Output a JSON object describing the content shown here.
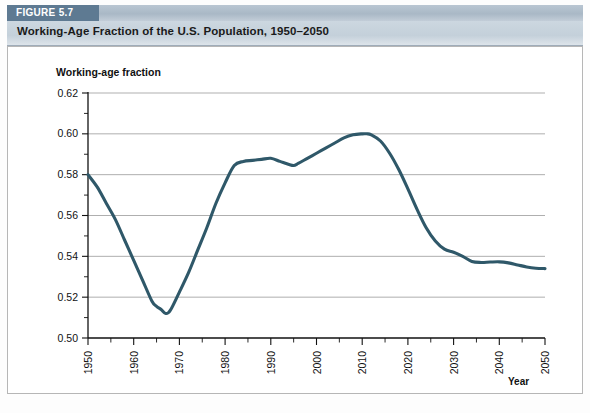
{
  "figure": {
    "tag": "FIGURE 5.7",
    "title": "Working-Age Fraction of the U.S. Population, 1950–2050"
  },
  "colors": {
    "line": "#2f5869",
    "tag_bg": "#5e7a92",
    "title_bg": "#c7d2dc",
    "grid": "#8d8d8d",
    "axis": "#111111"
  },
  "chart_data": {
    "type": "line",
    "title": "Working-Age Fraction of the U.S. Population, 1950–2050",
    "xlabel": "Year",
    "ylabel": "Working-age fraction",
    "xlim": [
      1950,
      2050
    ],
    "ylim": [
      0.5,
      0.62
    ],
    "grid": true,
    "legend": "none",
    "x_ticks": [
      1950,
      1960,
      1970,
      1980,
      1990,
      2000,
      2010,
      2020,
      2030,
      2040,
      2050
    ],
    "x_tick_labels": [
      "1950",
      "1960",
      "1970",
      "1980",
      "1990",
      "2000",
      "2010",
      "2020",
      "2030",
      "2040",
      "2050"
    ],
    "x_minor_step": 5,
    "y_ticks": [
      0.5,
      0.52,
      0.54,
      0.56,
      0.58,
      0.6,
      0.62
    ],
    "y_tick_labels": [
      "0.50",
      "0.52",
      "0.54",
      "0.56",
      "0.58",
      "0.60",
      "0.62"
    ],
    "y_minor_step": 0.01,
    "series": [
      {
        "name": "Working-age fraction",
        "color": "#2f5869",
        "x": [
          1950,
          1952,
          1954,
          1956,
          1958,
          1960,
          1962,
          1964,
          1965,
          1966,
          1967,
          1968,
          1970,
          1972,
          1974,
          1976,
          1978,
          1980,
          1982,
          1984,
          1986,
          1988,
          1990,
          1992,
          1994,
          1995,
          1996,
          1998,
          2000,
          2002,
          2004,
          2006,
          2008,
          2010,
          2011,
          2012,
          2014,
          2016,
          2018,
          2020,
          2022,
          2024,
          2026,
          2028,
          2030,
          2032,
          2034,
          2036,
          2038,
          2040,
          2042,
          2044,
          2046,
          2048,
          2050
        ],
        "y": [
          0.58,
          0.574,
          0.566,
          0.558,
          0.548,
          0.538,
          0.528,
          0.518,
          0.5155,
          0.514,
          0.512,
          0.5135,
          0.5225,
          0.532,
          0.543,
          0.554,
          0.566,
          0.576,
          0.5845,
          0.5865,
          0.587,
          0.5875,
          0.588,
          0.5865,
          0.585,
          0.5845,
          0.5855,
          0.588,
          0.5905,
          0.593,
          0.5955,
          0.598,
          0.5995,
          0.6,
          0.6,
          0.5995,
          0.5965,
          0.5905,
          0.5825,
          0.573,
          0.563,
          0.554,
          0.5475,
          0.5435,
          0.542,
          0.54,
          0.5375,
          0.537,
          0.5372,
          0.5373,
          0.5368,
          0.5358,
          0.5348,
          0.5342,
          0.534
        ]
      }
    ],
    "annotations": {
      "start_value": 0.58,
      "minimum": {
        "year": 1967,
        "value": 0.512
      },
      "plateau_1980s_1990s": {
        "range": [
          1982,
          1996
        ],
        "value_approx": 0.586
      },
      "peak": {
        "year": 2010,
        "value": 0.6
      },
      "end_value": {
        "year": 2050,
        "value": 0.534
      }
    }
  }
}
